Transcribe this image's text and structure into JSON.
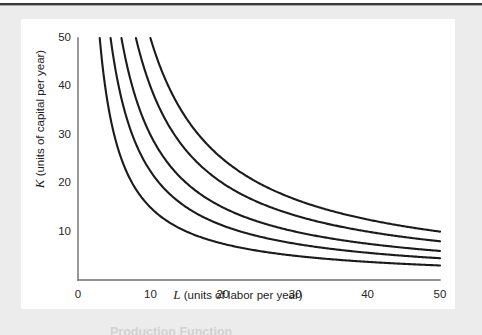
{
  "figure": {
    "panel_background": "#ffffff",
    "page_background": "#ececec",
    "rule_color": "#3a3a3a"
  },
  "caption": {
    "text": "Production Function"
  },
  "chart_data": {
    "type": "line",
    "title": "",
    "subtitle": "",
    "xlabel_var": "L",
    "xlabel_rest": " (units of labor per year)",
    "ylabel_var": "K",
    "ylabel_rest": " (units of capital per year)",
    "xlim": [
      0,
      50
    ],
    "ylim": [
      0,
      50
    ],
    "xticks": [
      0,
      10,
      20,
      30,
      40,
      50
    ],
    "yticks": [
      10,
      20,
      30,
      40,
      50
    ],
    "xtick_labels": [
      "0",
      "10",
      "20",
      "30",
      "40",
      "50"
    ],
    "ytick_labels": [
      "10",
      "20",
      "30",
      "40",
      "50"
    ],
    "grid": false,
    "legend": "none",
    "curve_family": "isoquant K = C / L",
    "series": [
      {
        "name": "isoquant-1",
        "constant": 150,
        "start_point": [
          3,
          50
        ],
        "end_point": [
          50,
          3
        ],
        "values": [
          [
            3,
            50
          ],
          [
            3.5,
            42.9
          ],
          [
            4,
            37.5
          ],
          [
            5,
            30
          ],
          [
            6,
            25
          ],
          [
            7,
            21.4
          ],
          [
            8,
            18.8
          ],
          [
            9,
            16.7
          ],
          [
            10,
            15
          ],
          [
            12,
            12.5
          ],
          [
            14,
            10.7
          ],
          [
            16,
            9.4
          ],
          [
            18,
            8.3
          ],
          [
            20,
            7.5
          ],
          [
            25,
            6
          ],
          [
            30,
            5
          ],
          [
            35,
            4.3
          ],
          [
            40,
            3.8
          ],
          [
            45,
            3.3
          ],
          [
            50,
            3
          ]
        ]
      },
      {
        "name": "isoquant-2",
        "constant": 225,
        "start_point": [
          4.5,
          50
        ],
        "end_point": [
          50,
          4.5
        ],
        "values": [
          [
            4.5,
            50
          ],
          [
            5,
            45
          ],
          [
            6,
            37.5
          ],
          [
            7,
            32.1
          ],
          [
            8,
            28.1
          ],
          [
            9,
            25
          ],
          [
            10,
            22.5
          ],
          [
            12,
            18.8
          ],
          [
            14,
            16.1
          ],
          [
            16,
            14.1
          ],
          [
            18,
            12.5
          ],
          [
            20,
            11.3
          ],
          [
            25,
            9
          ],
          [
            30,
            7.5
          ],
          [
            35,
            6.4
          ],
          [
            40,
            5.6
          ],
          [
            45,
            5
          ],
          [
            50,
            4.5
          ]
        ]
      },
      {
        "name": "isoquant-3",
        "constant": 300,
        "start_point": [
          6,
          50
        ],
        "end_point": [
          50,
          6
        ],
        "values": [
          [
            6,
            50
          ],
          [
            7,
            42.9
          ],
          [
            8,
            37.5
          ],
          [
            9,
            33.3
          ],
          [
            10,
            30
          ],
          [
            12,
            25
          ],
          [
            14,
            21.4
          ],
          [
            16,
            18.8
          ],
          [
            18,
            16.7
          ],
          [
            20,
            15
          ],
          [
            25,
            12
          ],
          [
            30,
            10
          ],
          [
            35,
            8.6
          ],
          [
            40,
            7.5
          ],
          [
            45,
            6.7
          ],
          [
            50,
            6
          ]
        ]
      },
      {
        "name": "isoquant-4",
        "constant": 400,
        "start_point": [
          8,
          50
        ],
        "end_point": [
          50,
          8
        ],
        "values": [
          [
            8,
            50
          ],
          [
            9,
            44.4
          ],
          [
            10,
            40
          ],
          [
            12,
            33.3
          ],
          [
            14,
            28.6
          ],
          [
            16,
            25
          ],
          [
            18,
            22.2
          ],
          [
            20,
            20
          ],
          [
            25,
            16
          ],
          [
            30,
            13.3
          ],
          [
            35,
            11.4
          ],
          [
            40,
            10
          ],
          [
            45,
            8.9
          ],
          [
            50,
            8
          ]
        ]
      },
      {
        "name": "isoquant-5",
        "constant": 500,
        "start_point": [
          10,
          50
        ],
        "end_point": [
          50,
          10
        ],
        "values": [
          [
            10,
            50
          ],
          [
            12,
            41.7
          ],
          [
            14,
            35.7
          ],
          [
            16,
            31.3
          ],
          [
            18,
            27.8
          ],
          [
            20,
            25
          ],
          [
            25,
            20
          ],
          [
            30,
            16.7
          ],
          [
            35,
            14.3
          ],
          [
            40,
            12.5
          ],
          [
            45,
            11.1
          ],
          [
            50,
            10
          ]
        ]
      }
    ]
  }
}
